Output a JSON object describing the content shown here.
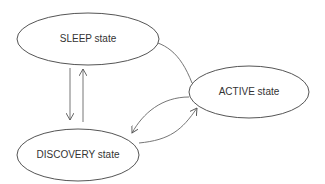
{
  "diagram": {
    "type": "state-transition",
    "colors": {
      "stroke": "#555555",
      "text": "#333333",
      "background": "#ffffff"
    },
    "nodes": [
      {
        "id": "sleep",
        "label": "SLEEP state"
      },
      {
        "id": "discovery",
        "label": "DISCOVERY state"
      },
      {
        "id": "active",
        "label": "ACTIVE state"
      }
    ],
    "edges": [
      {
        "from": "sleep",
        "to": "discovery"
      },
      {
        "from": "discovery",
        "to": "sleep"
      },
      {
        "from": "active",
        "to": "sleep"
      },
      {
        "from": "active",
        "to": "discovery"
      },
      {
        "from": "discovery",
        "to": "active"
      }
    ]
  }
}
